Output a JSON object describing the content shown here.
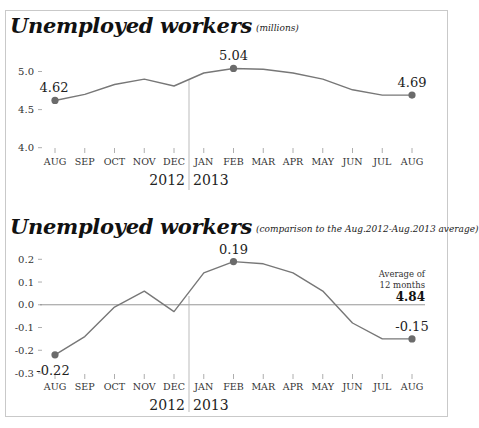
{
  "chart_data": [
    {
      "type": "line",
      "title": "Unemployed workers",
      "subtitle": "(millions)",
      "xlabel": "",
      "ylabel": "",
      "categories": [
        "AUG",
        "SEP",
        "OCT",
        "NOV",
        "DEC",
        "JAN",
        "FEB",
        "MAR",
        "APR",
        "MAY",
        "JUN",
        "JUL",
        "AUG"
      ],
      "year_labels": [
        "2012",
        "2013"
      ],
      "values": [
        4.62,
        4.7,
        4.83,
        4.9,
        4.81,
        4.98,
        5.04,
        5.03,
        4.98,
        4.9,
        4.76,
        4.69,
        4.69
      ],
      "ylim": [
        4.0,
        5.0
      ],
      "yticks": [
        "4.0",
        "4.5",
        "5.0"
      ],
      "annotations": [
        {
          "index": 0,
          "label": "4.62"
        },
        {
          "index": 6,
          "label": "5.04"
        },
        {
          "index": 12,
          "label": "4.69"
        }
      ],
      "grid": false,
      "legend": null
    },
    {
      "type": "line",
      "title": "Unemployed workers",
      "subtitle": "(comparison to the Aug.2012-Aug.2013 average)",
      "xlabel": "",
      "ylabel": "",
      "categories": [
        "AUG",
        "SEP",
        "OCT",
        "NOV",
        "DEC",
        "JAN",
        "FEB",
        "MAR",
        "APR",
        "MAY",
        "JUN",
        "JUL",
        "AUG"
      ],
      "year_labels": [
        "2012",
        "2013"
      ],
      "values": [
        -0.22,
        -0.14,
        -0.01,
        0.06,
        -0.03,
        0.14,
        0.19,
        0.18,
        0.14,
        0.06,
        -0.08,
        -0.15,
        -0.15
      ],
      "ylim": [
        -0.3,
        0.2
      ],
      "yticks": [
        "0.2",
        "0.1",
        "0.0",
        "-0.1",
        "-0.2",
        "-0.3"
      ],
      "annotations": [
        {
          "index": 0,
          "label": "-0.22"
        },
        {
          "index": 6,
          "label": "0.19"
        },
        {
          "index": 12,
          "label": "-0.15"
        }
      ],
      "reference_line": {
        "value": 0.0,
        "label_line1": "Average of",
        "label_line2": "12 months",
        "label_value": "4.84"
      },
      "grid": false,
      "legend": null
    }
  ],
  "colors": {
    "line": "#777777",
    "marker": "#6b6b6b",
    "axis": "#999999",
    "frame": "#c9c9c9"
  }
}
